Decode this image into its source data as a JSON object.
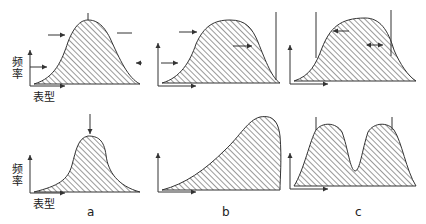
{
  "figure": {
    "axis_labels": {
      "y": "频率",
      "x": "表型"
    },
    "panels": [
      {
        "letter": "a",
        "type": "stabilizing"
      },
      {
        "letter": "b",
        "type": "directional"
      },
      {
        "letter": "c",
        "type": "disruptive"
      }
    ],
    "colors": {
      "stroke": "#333333",
      "hatch": "#555555",
      "background": "#ffffff"
    }
  }
}
